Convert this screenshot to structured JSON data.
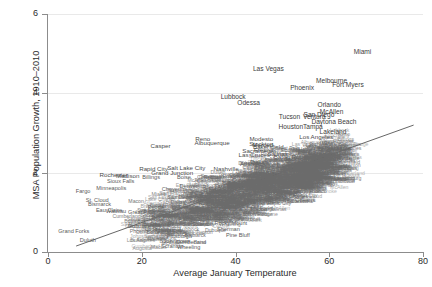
{
  "chart_data": {
    "type": "scatter",
    "title": "",
    "xlabel": "Average January Temperature",
    "ylabel": "MSA Population Growth, 1910–2010",
    "xlim": [
      0,
      80
    ],
    "ylim": [
      0,
      6
    ],
    "xticks": [
      0,
      20,
      40,
      60,
      80
    ],
    "yticks": [
      0,
      2,
      4,
      6
    ],
    "grid": true,
    "legend": null,
    "marker_style": "city-name-labels",
    "fit_line": {
      "x": [
        6,
        78
      ],
      "y": [
        0.15,
        3.2
      ],
      "visible": true
    },
    "points": [
      {
        "label": "Miami",
        "x": 67.1,
        "y": 5.05
      },
      {
        "label": "Las Vegas",
        "x": 47.0,
        "y": 4.62
      },
      {
        "label": "Melbourne",
        "x": 60.5,
        "y": 4.3
      },
      {
        "label": "Fort Myers",
        "x": 64.0,
        "y": 4.22
      },
      {
        "label": "Phoenix",
        "x": 54.2,
        "y": 4.14
      },
      {
        "label": "Lubbock",
        "x": 39.5,
        "y": 3.92
      },
      {
        "label": "Odessa",
        "x": 42.8,
        "y": 3.76
      },
      {
        "label": "Orlando",
        "x": 60.0,
        "y": 3.7
      },
      {
        "label": "McAllen",
        "x": 60.5,
        "y": 3.54
      },
      {
        "label": "San Diego",
        "x": 57.8,
        "y": 3.46
      },
      {
        "label": "Tucson",
        "x": 51.5,
        "y": 3.4
      },
      {
        "label": "Ventura",
        "x": 56.8,
        "y": 3.4
      },
      {
        "label": "Daytona Beach",
        "x": 61.0,
        "y": 3.28
      },
      {
        "label": "Houston",
        "x": 51.8,
        "y": 3.16
      },
      {
        "label": "Tampa",
        "x": 56.5,
        "y": 3.15
      },
      {
        "label": "Lakeland",
        "x": 60.8,
        "y": 3.02
      },
      {
        "label": "Los Angeles",
        "x": 57.2,
        "y": 2.9
      },
      {
        "label": "Reno",
        "x": 33.0,
        "y": 2.86
      },
      {
        "label": "Modesto",
        "x": 45.5,
        "y": 2.84
      },
      {
        "label": "Albuquerque",
        "x": 35.0,
        "y": 2.76
      },
      {
        "label": "Stockton",
        "x": 45.5,
        "y": 2.72
      },
      {
        "label": "Merced",
        "x": 45.8,
        "y": 2.7
      },
      {
        "label": "Casper",
        "x": 24.0,
        "y": 2.66
      },
      {
        "label": "Bakersfield",
        "x": 47.0,
        "y": 2.64
      },
      {
        "label": "Fresno",
        "x": 46.0,
        "y": 2.56
      },
      {
        "label": "Sacramento",
        "x": 45.0,
        "y": 2.54
      },
      {
        "label": "Sarasota",
        "x": 62.0,
        "y": 2.62
      },
      {
        "label": "Salinas",
        "x": 49.0,
        "y": 2.48
      },
      {
        "label": "Las Cruces",
        "x": 44.0,
        "y": 2.44
      },
      {
        "label": "Baton Rouge",
        "x": 52.0,
        "y": 2.4
      },
      {
        "label": "Brownsville",
        "x": 61.5,
        "y": 2.38
      },
      {
        "label": "Jacksonville",
        "x": 54.0,
        "y": 2.34
      },
      {
        "label": "Rapid City",
        "x": 22.5,
        "y": 2.1
      },
      {
        "label": "Salt Lake City",
        "x": 29.5,
        "y": 2.12
      },
      {
        "label": "Grand Junction",
        "x": 26.5,
        "y": 2.0
      },
      {
        "label": "Rochester",
        "x": 14.0,
        "y": 1.94
      },
      {
        "label": "Madison",
        "x": 17.0,
        "y": 1.92
      },
      {
        "label": "Billings",
        "x": 22.0,
        "y": 1.9
      },
      {
        "label": "Boise",
        "x": 29.0,
        "y": 1.88
      },
      {
        "label": "Sioux Falls",
        "x": 15.5,
        "y": 1.78
      },
      {
        "label": "Minneapolis",
        "x": 13.5,
        "y": 1.62
      },
      {
        "label": "Fargo",
        "x": 7.5,
        "y": 1.55
      },
      {
        "label": "Cheyenne",
        "x": 27.0,
        "y": 1.6
      },
      {
        "label": "Denver",
        "x": 30.0,
        "y": 1.66
      },
      {
        "label": "St. Cloud",
        "x": 10.5,
        "y": 1.3
      },
      {
        "label": "Bismarck",
        "x": 11.0,
        "y": 1.2
      },
      {
        "label": "Eau Claire",
        "x": 13.0,
        "y": 1.06
      },
      {
        "label": "Wausau",
        "x": 14.5,
        "y": 1.04
      },
      {
        "label": "Great Falls",
        "x": 20.0,
        "y": 1.0
      },
      {
        "label": "Buffalo",
        "x": 24.0,
        "y": 0.86
      },
      {
        "label": "Dubuque",
        "x": 19.5,
        "y": 0.66
      },
      {
        "label": "Grand Forks",
        "x": 5.5,
        "y": 0.52
      },
      {
        "label": "Duluth",
        "x": 8.5,
        "y": 0.3
      },
      {
        "label": "Pittsburgh",
        "x": 28.0,
        "y": 0.4
      },
      {
        "label": "Johnstown",
        "x": 27.5,
        "y": 0.28
      },
      {
        "label": "Scranton",
        "x": 26.5,
        "y": 0.16
      },
      {
        "label": "Wheeling",
        "x": 30.0,
        "y": 0.12
      },
      {
        "label": "Cumberland",
        "x": 30.5,
        "y": 0.26
      },
      {
        "label": "Pine Bluff",
        "x": 40.5,
        "y": 0.44
      },
      {
        "label": "Sherman",
        "x": 38.5,
        "y": 0.58
      },
      {
        "label": "Rocky Mount",
        "x": 39.0,
        "y": 0.72
      },
      {
        "label": "San Francisco",
        "x": 49.5,
        "y": 1.52
      },
      {
        "label": "New Orleans",
        "x": 53.5,
        "y": 1.32
      },
      {
        "label": "Lake Charles",
        "x": 52.0,
        "y": 1.4
      },
      {
        "label": "Charleston",
        "x": 48.0,
        "y": 1.8
      },
      {
        "label": "Augusta",
        "x": 46.5,
        "y": 1.96
      },
      {
        "label": "Nashville",
        "x": 38.0,
        "y": 2.08
      },
      {
        "label": "Atlanta",
        "x": 43.0,
        "y": 2.22
      },
      {
        "label": "Dallas",
        "x": 45.0,
        "y": 2.28
      },
      {
        "label": "Columbia",
        "x": 45.5,
        "y": 2.0
      },
      {
        "label": "Memphis",
        "x": 41.0,
        "y": 1.7
      },
      {
        "label": "Richmond",
        "x": 37.0,
        "y": 1.6
      },
      {
        "label": "Roanoke",
        "x": 34.5,
        "y": 1.24
      },
      {
        "label": "Knoxville",
        "x": 38.0,
        "y": 1.12
      },
      {
        "label": "Macon",
        "x": 45.0,
        "y": 1.08
      },
      {
        "label": "Mobile",
        "x": 51.0,
        "y": 1.86
      },
      {
        "label": "Savannah",
        "x": 50.0,
        "y": 1.74
      },
      {
        "label": "Lynchburg",
        "x": 36.0,
        "y": 0.96
      },
      {
        "label": "Utica",
        "x": 22.0,
        "y": 0.58
      },
      {
        "label": "Binghamton",
        "x": 23.5,
        "y": 0.7
      },
      {
        "label": "Erie",
        "x": 25.5,
        "y": 0.92
      },
      {
        "label": "Peoria",
        "x": 23.0,
        "y": 1.14
      },
      {
        "label": "Fresno",
        "x": 46.2,
        "y": 2.18
      }
    ]
  },
  "axes": {
    "y_title": "MSA Population Growth, 1910–2010",
    "x_title": "Average January Temperature",
    "y_tick_labels": [
      "0",
      "2",
      "4",
      "6"
    ],
    "x_tick_labels": [
      "0",
      "20",
      "40",
      "60",
      "80"
    ]
  },
  "colors": {
    "background": "#ffffff",
    "axis": "#8c8c8c",
    "grid": "#e9e9e9",
    "label_text": "#2b2b2b",
    "marker_text": "#4a4a4a",
    "fit_line": "#555555"
  }
}
